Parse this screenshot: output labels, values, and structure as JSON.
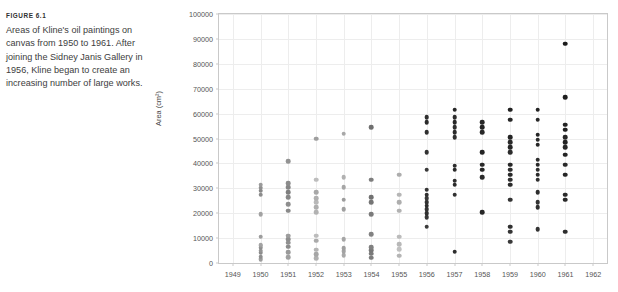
{
  "figure": {
    "label": "FIGURE 6.1",
    "caption": "Areas of Kline's oil paintings on canvas from 1950 to 1961. After joining the Sidney Janis Gallery in 1956, Kline began to create an increasing number of large works."
  },
  "chart_data": {
    "type": "scatter",
    "title": "",
    "xlabel": "",
    "ylabel": "Area (cm²)",
    "xlim": [
      1948.5,
      1962.5
    ],
    "ylim": [
      0,
      100000
    ],
    "xticks": [
      1949,
      1950,
      1951,
      1952,
      1953,
      1954,
      1955,
      1956,
      1957,
      1958,
      1959,
      1960,
      1961,
      1962
    ],
    "yticks": [
      0,
      10000,
      20000,
      30000,
      40000,
      50000,
      60000,
      70000,
      80000,
      90000,
      100000
    ],
    "grid": true,
    "legend": false,
    "marker_color_early": "#b9b9b9",
    "marker_color_late": "#222222",
    "series": [
      {
        "name": "Kline oil paintings",
        "points": [
          {
            "x": 1950,
            "y": 1500,
            "shade": "#9d9d9d"
          },
          {
            "x": 1950,
            "y": 2600,
            "shade": "#8e8e8e"
          },
          {
            "x": 1950,
            "y": 4200,
            "shade": "#8a8a8a"
          },
          {
            "x": 1950,
            "y": 5000,
            "shade": "#949494"
          },
          {
            "x": 1950,
            "y": 6200,
            "shade": "#8d8d8d"
          },
          {
            "x": 1950,
            "y": 7000,
            "shade": "#9a9a9a"
          },
          {
            "x": 1950,
            "y": 7400,
            "shade": "#a3a3a3"
          },
          {
            "x": 1950,
            "y": 10500,
            "shade": "#9c9c9c"
          },
          {
            "x": 1950,
            "y": 19500,
            "shade": "#a2a2a2"
          },
          {
            "x": 1950,
            "y": 27500,
            "shade": "#8c8c8c"
          },
          {
            "x": 1950,
            "y": 29000,
            "shade": "#888888"
          },
          {
            "x": 1950,
            "y": 30200,
            "shade": "#8f8f8f"
          },
          {
            "x": 1950,
            "y": 31500,
            "shade": "#9b9b9b"
          },
          {
            "x": 1951,
            "y": 2400,
            "shade": "#a0a0a0"
          },
          {
            "x": 1951,
            "y": 4400,
            "shade": "#9a9a9a"
          },
          {
            "x": 1951,
            "y": 6500,
            "shade": "#8b8b8b"
          },
          {
            "x": 1951,
            "y": 8200,
            "shade": "#909090"
          },
          {
            "x": 1951,
            "y": 9500,
            "shade": "#8e8e8e"
          },
          {
            "x": 1951,
            "y": 11000,
            "shade": "#9d9d9d"
          },
          {
            "x": 1951,
            "y": 21000,
            "shade": "#8a8a8a"
          },
          {
            "x": 1951,
            "y": 23500,
            "shade": "#8e8e8e"
          },
          {
            "x": 1951,
            "y": 26500,
            "shade": "#878787"
          },
          {
            "x": 1951,
            "y": 28500,
            "shade": "#7f7f7f"
          },
          {
            "x": 1951,
            "y": 30500,
            "shade": "#868686"
          },
          {
            "x": 1951,
            "y": 32000,
            "shade": "#8c8c8c"
          },
          {
            "x": 1951,
            "y": 41000,
            "shade": "#939393"
          },
          {
            "x": 1952,
            "y": 2000,
            "shade": "#b0b0b0"
          },
          {
            "x": 1952,
            "y": 3600,
            "shade": "#a6a6a6"
          },
          {
            "x": 1952,
            "y": 5400,
            "shade": "#b4b4b4"
          },
          {
            "x": 1952,
            "y": 9000,
            "shade": "#aaaaaa"
          },
          {
            "x": 1952,
            "y": 11000,
            "shade": "#bcbcbc"
          },
          {
            "x": 1952,
            "y": 20500,
            "shade": "#b2b2b2"
          },
          {
            "x": 1952,
            "y": 22500,
            "shade": "#aeaeae"
          },
          {
            "x": 1952,
            "y": 24500,
            "shade": "#b8b8b8"
          },
          {
            "x": 1952,
            "y": 26000,
            "shade": "#b0b0b0"
          },
          {
            "x": 1952,
            "y": 28500,
            "shade": "#a8a8a8"
          },
          {
            "x": 1952,
            "y": 33500,
            "shade": "#bdbdbd"
          },
          {
            "x": 1952,
            "y": 50000,
            "shade": "#9e9e9e"
          },
          {
            "x": 1953,
            "y": 3200,
            "shade": "#a9a9a9"
          },
          {
            "x": 1953,
            "y": 4800,
            "shade": "#a3a3a3"
          },
          {
            "x": 1953,
            "y": 6000,
            "shade": "#9f9f9f"
          },
          {
            "x": 1953,
            "y": 9500,
            "shade": "#a5a5a5"
          },
          {
            "x": 1953,
            "y": 21500,
            "shade": "#a0a0a0"
          },
          {
            "x": 1953,
            "y": 25500,
            "shade": "#9c9c9c"
          },
          {
            "x": 1953,
            "y": 30500,
            "shade": "#a6a6a6"
          },
          {
            "x": 1953,
            "y": 34500,
            "shade": "#b1b1b1"
          },
          {
            "x": 1953,
            "y": 52000,
            "shade": "#a8a8a8"
          },
          {
            "x": 1954,
            "y": 2200,
            "shade": "#7c7c7c"
          },
          {
            "x": 1954,
            "y": 3800,
            "shade": "#7a7a7a"
          },
          {
            "x": 1954,
            "y": 5200,
            "shade": "#777777"
          },
          {
            "x": 1954,
            "y": 6400,
            "shade": "#808080"
          },
          {
            "x": 1954,
            "y": 11500,
            "shade": "#828282"
          },
          {
            "x": 1954,
            "y": 19500,
            "shade": "#7b7b7b"
          },
          {
            "x": 1954,
            "y": 24500,
            "shade": "#757575"
          },
          {
            "x": 1954,
            "y": 26500,
            "shade": "#717171"
          },
          {
            "x": 1954,
            "y": 33500,
            "shade": "#7e7e7e"
          },
          {
            "x": 1954,
            "y": 54500,
            "shade": "#6f6f6f"
          },
          {
            "x": 1955,
            "y": 3000,
            "shade": "#b5b5b5"
          },
          {
            "x": 1955,
            "y": 5500,
            "shade": "#c0c0c0"
          },
          {
            "x": 1955,
            "y": 7500,
            "shade": "#b8b8b8"
          },
          {
            "x": 1955,
            "y": 10500,
            "shade": "#bbbbbb"
          },
          {
            "x": 1955,
            "y": 21000,
            "shade": "#b2b2b2"
          },
          {
            "x": 1955,
            "y": 24500,
            "shade": "#aeaeae"
          },
          {
            "x": 1955,
            "y": 27500,
            "shade": "#b6b6b6"
          },
          {
            "x": 1955,
            "y": 35500,
            "shade": "#adadad"
          },
          {
            "x": 1956,
            "y": 14500,
            "shade": "#3c3c3c"
          },
          {
            "x": 1956,
            "y": 18500,
            "shade": "#383838"
          },
          {
            "x": 1956,
            "y": 20000,
            "shade": "#303030"
          },
          {
            "x": 1956,
            "y": 21500,
            "shade": "#343434"
          },
          {
            "x": 1956,
            "y": 23000,
            "shade": "#2c2c2c"
          },
          {
            "x": 1956,
            "y": 24500,
            "shade": "#323232"
          },
          {
            "x": 1956,
            "y": 26000,
            "shade": "#383838"
          },
          {
            "x": 1956,
            "y": 27500,
            "shade": "#2f2f2f"
          },
          {
            "x": 1956,
            "y": 29500,
            "shade": "#353535"
          },
          {
            "x": 1956,
            "y": 37500,
            "shade": "#3a3a3a"
          },
          {
            "x": 1956,
            "y": 44500,
            "shade": "#333333"
          },
          {
            "x": 1956,
            "y": 52500,
            "shade": "#303030"
          },
          {
            "x": 1956,
            "y": 56500,
            "shade": "#2b2b2b"
          },
          {
            "x": 1956,
            "y": 58500,
            "shade": "#2f2f2f"
          },
          {
            "x": 1957,
            "y": 4500,
            "shade": "#2d2d2d"
          },
          {
            "x": 1957,
            "y": 27500,
            "shade": "#313131"
          },
          {
            "x": 1957,
            "y": 31500,
            "shade": "#2a2a2a"
          },
          {
            "x": 1957,
            "y": 33000,
            "shade": "#2e2e2e"
          },
          {
            "x": 1957,
            "y": 37500,
            "shade": "#292929"
          },
          {
            "x": 1957,
            "y": 39000,
            "shade": "#2d2d2d"
          },
          {
            "x": 1957,
            "y": 50500,
            "shade": "#303030"
          },
          {
            "x": 1957,
            "y": 52500,
            "shade": "#2b2b2b"
          },
          {
            "x": 1957,
            "y": 54500,
            "shade": "#2f2f2f"
          },
          {
            "x": 1957,
            "y": 56500,
            "shade": "#282828"
          },
          {
            "x": 1957,
            "y": 58500,
            "shade": "#2c2c2c"
          },
          {
            "x": 1957,
            "y": 61500,
            "shade": "#272727"
          },
          {
            "x": 1958,
            "y": 20500,
            "shade": "#262626"
          },
          {
            "x": 1958,
            "y": 34500,
            "shade": "#2a2a2a"
          },
          {
            "x": 1958,
            "y": 37500,
            "shade": "#252525"
          },
          {
            "x": 1958,
            "y": 39500,
            "shade": "#292929"
          },
          {
            "x": 1958,
            "y": 44500,
            "shade": "#242424"
          },
          {
            "x": 1958,
            "y": 52500,
            "shade": "#282828"
          },
          {
            "x": 1958,
            "y": 54500,
            "shade": "#232323"
          },
          {
            "x": 1958,
            "y": 56500,
            "shade": "#272727"
          },
          {
            "x": 1959,
            "y": 8500,
            "shade": "#3a3a3a"
          },
          {
            "x": 1959,
            "y": 12500,
            "shade": "#353535"
          },
          {
            "x": 1959,
            "y": 14500,
            "shade": "#303030"
          },
          {
            "x": 1959,
            "y": 25500,
            "shade": "#343434"
          },
          {
            "x": 1959,
            "y": 31500,
            "shade": "#2c2c2c"
          },
          {
            "x": 1959,
            "y": 33500,
            "shade": "#303030"
          },
          {
            "x": 1959,
            "y": 35500,
            "shade": "#2a2a2a"
          },
          {
            "x": 1959,
            "y": 37500,
            "shade": "#2e2e2e"
          },
          {
            "x": 1959,
            "y": 39500,
            "shade": "#282828"
          },
          {
            "x": 1959,
            "y": 44500,
            "shade": "#2c2c2c"
          },
          {
            "x": 1959,
            "y": 46500,
            "shade": "#262626"
          },
          {
            "x": 1959,
            "y": 48500,
            "shade": "#2a2a2a"
          },
          {
            "x": 1959,
            "y": 50500,
            "shade": "#242424"
          },
          {
            "x": 1959,
            "y": 57500,
            "shade": "#282828"
          },
          {
            "x": 1959,
            "y": 61500,
            "shade": "#222222"
          },
          {
            "x": 1960,
            "y": 13500,
            "shade": "#343434"
          },
          {
            "x": 1960,
            "y": 22500,
            "shade": "#2f2f2f"
          },
          {
            "x": 1960,
            "y": 24500,
            "shade": "#333333"
          },
          {
            "x": 1960,
            "y": 28500,
            "shade": "#2d2d2d"
          },
          {
            "x": 1960,
            "y": 33500,
            "shade": "#313131"
          },
          {
            "x": 1960,
            "y": 35500,
            "shade": "#2b2b2b"
          },
          {
            "x": 1960,
            "y": 37500,
            "shade": "#2f2f2f"
          },
          {
            "x": 1960,
            "y": 39500,
            "shade": "#292929"
          },
          {
            "x": 1960,
            "y": 41500,
            "shade": "#2d2d2d"
          },
          {
            "x": 1960,
            "y": 47500,
            "shade": "#272727"
          },
          {
            "x": 1960,
            "y": 49500,
            "shade": "#2b2b2b"
          },
          {
            "x": 1960,
            "y": 51500,
            "shade": "#252525"
          },
          {
            "x": 1960,
            "y": 57500,
            "shade": "#292929"
          },
          {
            "x": 1960,
            "y": 61500,
            "shade": "#232323"
          },
          {
            "x": 1961,
            "y": 12500,
            "shade": "#2e2e2e"
          },
          {
            "x": 1961,
            "y": 25500,
            "shade": "#282828"
          },
          {
            "x": 1961,
            "y": 27500,
            "shade": "#2c2c2c"
          },
          {
            "x": 1961,
            "y": 35500,
            "shade": "#262626"
          },
          {
            "x": 1961,
            "y": 39500,
            "shade": "#2a2a2a"
          },
          {
            "x": 1961,
            "y": 43500,
            "shade": "#242424"
          },
          {
            "x": 1961,
            "y": 46500,
            "shade": "#282828"
          },
          {
            "x": 1961,
            "y": 48500,
            "shade": "#222222"
          },
          {
            "x": 1961,
            "y": 50500,
            "shade": "#262626"
          },
          {
            "x": 1961,
            "y": 53500,
            "shade": "#202020"
          },
          {
            "x": 1961,
            "y": 55500,
            "shade": "#242424"
          },
          {
            "x": 1961,
            "y": 66500,
            "shade": "#1e1e1e"
          },
          {
            "x": 1961,
            "y": 88000,
            "shade": "#1c1c1c"
          }
        ]
      }
    ]
  }
}
